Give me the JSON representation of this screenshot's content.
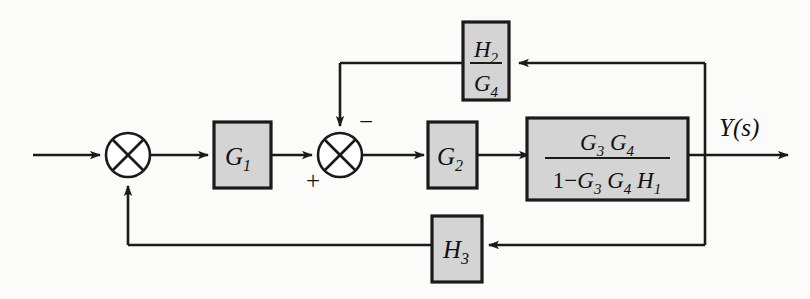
{
  "diagram": {
    "type": "block-diagram",
    "background_color": "#fbfbfa",
    "block_fill_color": "#d4d4d4",
    "line_color": "#1a1a1a",
    "blocks": [
      {
        "id": "g1",
        "label": "G",
        "subscript": "1",
        "kind": "gain-block"
      },
      {
        "id": "g2",
        "label": "G",
        "subscript": "2",
        "kind": "gain-block"
      },
      {
        "id": "h2g4",
        "numerator": "H",
        "numerator_sub": "2",
        "denominator": "G",
        "denominator_sub": "4",
        "kind": "fraction-block"
      },
      {
        "id": "h3",
        "label": "H",
        "subscript": "3",
        "kind": "gain-block"
      },
      {
        "id": "main",
        "numerator": "G₃ G₄",
        "denominator": "1 − G₃ G₄ H₁",
        "kind": "fraction-block"
      }
    ],
    "summing_junctions": [
      {
        "id": "sum1",
        "signs": []
      },
      {
        "id": "sum2",
        "signs": [
          "+",
          "−"
        ]
      }
    ],
    "signs": {
      "plus": "+",
      "minus": "−"
    },
    "labels": {
      "output": "Y(s)",
      "main_numerator_g3": "G",
      "main_numerator_g3_sub": "3",
      "main_numerator_g4": "G",
      "main_numerator_g4_sub": "4",
      "main_den_one": "1",
      "main_den_minus": "−",
      "main_den_g3": "G",
      "main_den_g3_sub": "3",
      "main_den_g4": "G",
      "main_den_g4_sub": "4",
      "main_den_h1": "H",
      "main_den_h1_sub": "1",
      "h2_num": "H",
      "h2_num_sub": "2",
      "g4_den": "G",
      "g4_den_sub": "4",
      "g1": "G",
      "g1_sub": "1",
      "g2": "G",
      "g2_sub": "2",
      "h3": "H",
      "h3_sub": "3"
    }
  }
}
